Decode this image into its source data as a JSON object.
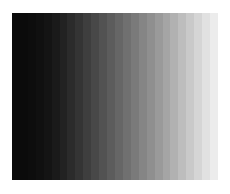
{
  "image": {
    "type": "grayscale-step-wedge",
    "orientation": "horizontal",
    "direction": "dark-to-light",
    "background": "#ffffff",
    "bands": [
      "#0a0a0a",
      "#0b0b0b",
      "#0d0d0d",
      "#101010",
      "#141414",
      "#1a1a1a",
      "#222222",
      "#2b2b2b",
      "#343434",
      "#3e3e3e",
      "#484848",
      "#525252",
      "#5c5c5c",
      "#666666",
      "#707070",
      "#7a7a7a",
      "#858585",
      "#8f8f8f",
      "#9a9a9a",
      "#a5a5a5",
      "#b1b1b1",
      "#bdbdbd",
      "#c9c9c9",
      "#d5d5d5",
      "#e1e1e1",
      "#ececec"
    ]
  }
}
